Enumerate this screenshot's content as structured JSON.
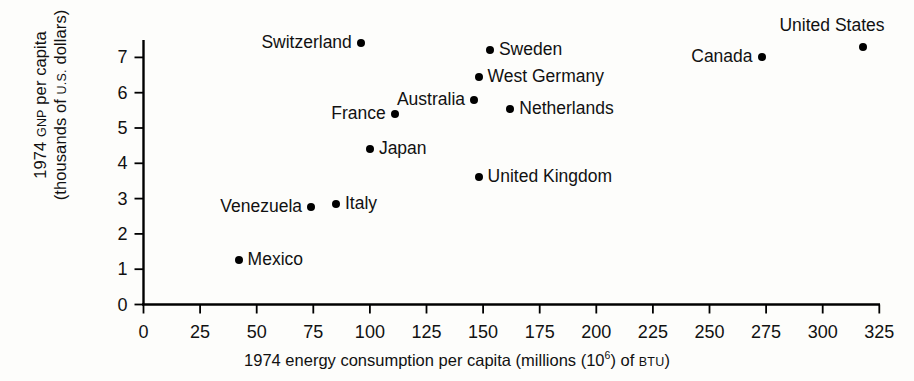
{
  "chart_data": {
    "type": "scatter",
    "title": "",
    "xlabel": "1974 energy consumption per capita (millions (10⁶) of BTU)",
    "xlabel_pre": "1974 energy consumption per capita (millions (10",
    "xlabel_sup": "6",
    "xlabel_post": ") of ",
    "xlabel_smallcaps": "BTU",
    "xlabel_end": ")",
    "ylabel_line1_pre": "1974 ",
    "ylabel_line1_smallcaps": "GNP",
    "ylabel_line1_post": " per capita",
    "ylabel_line2_pre": "(thousands of ",
    "ylabel_line2_smallcaps": "U.S.",
    "ylabel_line2_post": " dollars)",
    "ylabel": "1974 GNP per capita (thousands of U.S. dollars)",
    "xlim": [
      0,
      325
    ],
    "ylim": [
      0,
      7.6
    ],
    "xticks": [
      0,
      25,
      50,
      75,
      100,
      125,
      150,
      175,
      200,
      225,
      250,
      275,
      300,
      325
    ],
    "yticks": [
      0,
      1,
      2,
      3,
      4,
      5,
      6,
      7
    ],
    "grid": false,
    "legend": "none",
    "marker_color": "#000000",
    "axis_color": "#000000",
    "points": [
      {
        "label": "Mexico",
        "x": 42,
        "y": 1.25,
        "label_side": "right"
      },
      {
        "label": "Venezuela",
        "x": 74,
        "y": 2.75,
        "label_side": "left"
      },
      {
        "label": "Italy",
        "x": 85,
        "y": 2.85,
        "label_side": "right"
      },
      {
        "label": "Japan",
        "x": 100,
        "y": 4.4,
        "label_side": "right"
      },
      {
        "label": "Switzerland",
        "x": 96,
        "y": 7.4,
        "label_side": "left"
      },
      {
        "label": "France",
        "x": 111,
        "y": 5.4,
        "label_side": "left"
      },
      {
        "label": "United Kingdom",
        "x": 148,
        "y": 3.6,
        "label_side": "right"
      },
      {
        "label": "West Germany",
        "x": 148,
        "y": 6.45,
        "label_side": "right"
      },
      {
        "label": "Australia",
        "x": 146,
        "y": 5.8,
        "label_side": "left"
      },
      {
        "label": "Sweden",
        "x": 153,
        "y": 7.2,
        "label_side": "right"
      },
      {
        "label": "Netherlands",
        "x": 162,
        "y": 5.55,
        "label_side": "right"
      },
      {
        "label": "Canada",
        "x": 273,
        "y": 7.0,
        "label_side": "left"
      },
      {
        "label": "United States",
        "x": 318,
        "y": 7.3,
        "label_side": "above"
      }
    ]
  }
}
